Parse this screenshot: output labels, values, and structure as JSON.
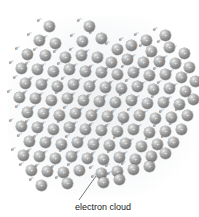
{
  "figure": {
    "background_color": "#ffffff"
  },
  "caption": {
    "text": "electron cloud",
    "color": "#222222"
  },
  "leader_line": {
    "from_x": 79,
    "from_y": 200,
    "to_x": 96,
    "to_y": 176,
    "color": "#555555"
  },
  "atom": {
    "charge_symbol": "+",
    "electron_symbol": "e⁻",
    "diameter_px": 11,
    "sphere_color": "#8b8b8b",
    "highlight_color": "#f2f2f2",
    "electron_color": "#4a4a4a"
  },
  "lattice": {
    "note": "hexagonal-ish packing of metal cations surrounded by delocalized electrons",
    "row_spacing": 15,
    "col_spacing": 16,
    "atoms": [
      {
        "x": 44,
        "y": 21
      },
      {
        "x": 84,
        "y": 21
      },
      {
        "x": 141,
        "y": 35
      },
      {
        "x": 160,
        "y": 30
      },
      {
        "x": 34,
        "y": 35
      },
      {
        "x": 50,
        "y": 38
      },
      {
        "x": 77,
        "y": 36
      },
      {
        "x": 96,
        "y": 33
      },
      {
        "x": 112,
        "y": 44
      },
      {
        "x": 126,
        "y": 40
      },
      {
        "x": 146,
        "y": 46
      },
      {
        "x": 164,
        "y": 42
      },
      {
        "x": 179,
        "y": 48
      },
      {
        "x": 22,
        "y": 49
      },
      {
        "x": 40,
        "y": 50
      },
      {
        "x": 60,
        "y": 52
      },
      {
        "x": 76,
        "y": 50
      },
      {
        "x": 92,
        "y": 52
      },
      {
        "x": 106,
        "y": 57
      },
      {
        "x": 122,
        "y": 54
      },
      {
        "x": 138,
        "y": 57
      },
      {
        "x": 154,
        "y": 56
      },
      {
        "x": 170,
        "y": 58
      },
      {
        "x": 184,
        "y": 62
      },
      {
        "x": 16,
        "y": 63
      },
      {
        "x": 32,
        "y": 64
      },
      {
        "x": 48,
        "y": 66
      },
      {
        "x": 64,
        "y": 64
      },
      {
        "x": 80,
        "y": 66
      },
      {
        "x": 96,
        "y": 67
      },
      {
        "x": 112,
        "y": 69
      },
      {
        "x": 128,
        "y": 67
      },
      {
        "x": 144,
        "y": 70
      },
      {
        "x": 160,
        "y": 69
      },
      {
        "x": 176,
        "y": 72
      },
      {
        "x": 190,
        "y": 76
      },
      {
        "x": 20,
        "y": 78
      },
      {
        "x": 36,
        "y": 79
      },
      {
        "x": 52,
        "y": 81
      },
      {
        "x": 68,
        "y": 79
      },
      {
        "x": 84,
        "y": 81
      },
      {
        "x": 100,
        "y": 82
      },
      {
        "x": 116,
        "y": 83
      },
      {
        "x": 132,
        "y": 81
      },
      {
        "x": 148,
        "y": 84
      },
      {
        "x": 164,
        "y": 83
      },
      {
        "x": 180,
        "y": 86
      },
      {
        "x": 14,
        "y": 92
      },
      {
        "x": 30,
        "y": 93
      },
      {
        "x": 46,
        "y": 95
      },
      {
        "x": 62,
        "y": 93
      },
      {
        "x": 78,
        "y": 95
      },
      {
        "x": 94,
        "y": 96
      },
      {
        "x": 110,
        "y": 97
      },
      {
        "x": 126,
        "y": 95
      },
      {
        "x": 142,
        "y": 98
      },
      {
        "x": 158,
        "y": 97
      },
      {
        "x": 174,
        "y": 99
      },
      {
        "x": 188,
        "y": 94
      },
      {
        "x": 22,
        "y": 107
      },
      {
        "x": 38,
        "y": 108
      },
      {
        "x": 54,
        "y": 110
      },
      {
        "x": 70,
        "y": 108
      },
      {
        "x": 86,
        "y": 110
      },
      {
        "x": 102,
        "y": 111
      },
      {
        "x": 118,
        "y": 112
      },
      {
        "x": 134,
        "y": 110
      },
      {
        "x": 150,
        "y": 113
      },
      {
        "x": 166,
        "y": 112
      },
      {
        "x": 182,
        "y": 110
      },
      {
        "x": 16,
        "y": 121
      },
      {
        "x": 32,
        "y": 122
      },
      {
        "x": 48,
        "y": 124
      },
      {
        "x": 64,
        "y": 122
      },
      {
        "x": 80,
        "y": 124
      },
      {
        "x": 96,
        "y": 125
      },
      {
        "x": 112,
        "y": 126
      },
      {
        "x": 128,
        "y": 124
      },
      {
        "x": 144,
        "y": 127
      },
      {
        "x": 160,
        "y": 126
      },
      {
        "x": 176,
        "y": 124
      },
      {
        "x": 24,
        "y": 136
      },
      {
        "x": 40,
        "y": 137
      },
      {
        "x": 56,
        "y": 139
      },
      {
        "x": 72,
        "y": 137
      },
      {
        "x": 88,
        "y": 139
      },
      {
        "x": 104,
        "y": 140
      },
      {
        "x": 120,
        "y": 138
      },
      {
        "x": 136,
        "y": 141
      },
      {
        "x": 152,
        "y": 139
      },
      {
        "x": 168,
        "y": 137
      },
      {
        "x": 18,
        "y": 150
      },
      {
        "x": 34,
        "y": 151
      },
      {
        "x": 50,
        "y": 153
      },
      {
        "x": 66,
        "y": 151
      },
      {
        "x": 82,
        "y": 153
      },
      {
        "x": 98,
        "y": 154
      },
      {
        "x": 114,
        "y": 152
      },
      {
        "x": 130,
        "y": 154
      },
      {
        "x": 146,
        "y": 151
      },
      {
        "x": 160,
        "y": 148
      },
      {
        "x": 26,
        "y": 165
      },
      {
        "x": 42,
        "y": 166
      },
      {
        "x": 58,
        "y": 167
      },
      {
        "x": 74,
        "y": 165
      },
      {
        "x": 96,
        "y": 168
      },
      {
        "x": 112,
        "y": 166
      },
      {
        "x": 128,
        "y": 164
      },
      {
        "x": 144,
        "y": 161
      },
      {
        "x": 36,
        "y": 180
      },
      {
        "x": 62,
        "y": 178
      },
      {
        "x": 98,
        "y": 177
      },
      {
        "x": 114,
        "y": 174
      }
    ],
    "electrons": [
      {
        "x": 37,
        "y": 17
      },
      {
        "x": 77,
        "y": 17
      },
      {
        "x": 134,
        "y": 31
      },
      {
        "x": 153,
        "y": 26
      },
      {
        "x": 27,
        "y": 31
      },
      {
        "x": 43,
        "y": 34
      },
      {
        "x": 70,
        "y": 32
      },
      {
        "x": 89,
        "y": 29
      },
      {
        "x": 105,
        "y": 40
      },
      {
        "x": 119,
        "y": 36
      },
      {
        "x": 139,
        "y": 42
      },
      {
        "x": 157,
        "y": 38
      },
      {
        "x": 172,
        "y": 44
      },
      {
        "x": 15,
        "y": 45
      },
      {
        "x": 33,
        "y": 46
      },
      {
        "x": 53,
        "y": 48
      },
      {
        "x": 69,
        "y": 46
      },
      {
        "x": 85,
        "y": 48
      },
      {
        "x": 99,
        "y": 53
      },
      {
        "x": 115,
        "y": 50
      },
      {
        "x": 131,
        "y": 53
      },
      {
        "x": 147,
        "y": 52
      },
      {
        "x": 163,
        "y": 54
      },
      {
        "x": 177,
        "y": 58
      },
      {
        "x": 9,
        "y": 59
      },
      {
        "x": 25,
        "y": 60
      },
      {
        "x": 41,
        "y": 62
      },
      {
        "x": 57,
        "y": 60
      },
      {
        "x": 73,
        "y": 62
      },
      {
        "x": 89,
        "y": 63
      },
      {
        "x": 105,
        "y": 65
      },
      {
        "x": 121,
        "y": 63
      },
      {
        "x": 137,
        "y": 66
      },
      {
        "x": 153,
        "y": 65
      },
      {
        "x": 169,
        "y": 68
      },
      {
        "x": 183,
        "y": 72
      },
      {
        "x": 13,
        "y": 74
      },
      {
        "x": 29,
        "y": 75
      },
      {
        "x": 45,
        "y": 77
      },
      {
        "x": 61,
        "y": 75
      },
      {
        "x": 77,
        "y": 77
      },
      {
        "x": 93,
        "y": 78
      },
      {
        "x": 109,
        "y": 79
      },
      {
        "x": 125,
        "y": 77
      },
      {
        "x": 141,
        "y": 80
      },
      {
        "x": 157,
        "y": 79
      },
      {
        "x": 173,
        "y": 82
      },
      {
        "x": 7,
        "y": 88
      },
      {
        "x": 23,
        "y": 89
      },
      {
        "x": 39,
        "y": 91
      },
      {
        "x": 55,
        "y": 89
      },
      {
        "x": 71,
        "y": 91
      },
      {
        "x": 87,
        "y": 92
      },
      {
        "x": 103,
        "y": 93
      },
      {
        "x": 119,
        "y": 91
      },
      {
        "x": 135,
        "y": 94
      },
      {
        "x": 151,
        "y": 93
      },
      {
        "x": 167,
        "y": 95
      },
      {
        "x": 181,
        "y": 90
      },
      {
        "x": 15,
        "y": 103
      },
      {
        "x": 31,
        "y": 104
      },
      {
        "x": 47,
        "y": 106
      },
      {
        "x": 63,
        "y": 104
      },
      {
        "x": 79,
        "y": 106
      },
      {
        "x": 95,
        "y": 107
      },
      {
        "x": 111,
        "y": 108
      },
      {
        "x": 127,
        "y": 106
      },
      {
        "x": 143,
        "y": 109
      },
      {
        "x": 159,
        "y": 108
      },
      {
        "x": 175,
        "y": 106
      },
      {
        "x": 9,
        "y": 117
      },
      {
        "x": 25,
        "y": 118
      },
      {
        "x": 41,
        "y": 120
      },
      {
        "x": 57,
        "y": 118
      },
      {
        "x": 73,
        "y": 120
      },
      {
        "x": 89,
        "y": 121
      },
      {
        "x": 105,
        "y": 122
      },
      {
        "x": 121,
        "y": 120
      },
      {
        "x": 137,
        "y": 123
      },
      {
        "x": 153,
        "y": 122
      },
      {
        "x": 169,
        "y": 120
      },
      {
        "x": 17,
        "y": 132
      },
      {
        "x": 33,
        "y": 133
      },
      {
        "x": 49,
        "y": 135
      },
      {
        "x": 65,
        "y": 133
      },
      {
        "x": 81,
        "y": 135
      },
      {
        "x": 97,
        "y": 136
      },
      {
        "x": 113,
        "y": 134
      },
      {
        "x": 129,
        "y": 137
      },
      {
        "x": 145,
        "y": 135
      },
      {
        "x": 161,
        "y": 133
      },
      {
        "x": 11,
        "y": 146
      },
      {
        "x": 27,
        "y": 147
      },
      {
        "x": 43,
        "y": 149
      },
      {
        "x": 59,
        "y": 147
      },
      {
        "x": 75,
        "y": 149
      },
      {
        "x": 91,
        "y": 150
      },
      {
        "x": 107,
        "y": 148
      },
      {
        "x": 123,
        "y": 150
      },
      {
        "x": 139,
        "y": 147
      },
      {
        "x": 153,
        "y": 144
      },
      {
        "x": 19,
        "y": 161
      },
      {
        "x": 35,
        "y": 162
      },
      {
        "x": 51,
        "y": 163
      },
      {
        "x": 67,
        "y": 161
      },
      {
        "x": 89,
        "y": 164
      },
      {
        "x": 105,
        "y": 162
      },
      {
        "x": 121,
        "y": 160
      },
      {
        "x": 137,
        "y": 157
      },
      {
        "x": 29,
        "y": 176
      },
      {
        "x": 55,
        "y": 174
      },
      {
        "x": 91,
        "y": 173
      },
      {
        "x": 107,
        "y": 170
      }
    ]
  }
}
